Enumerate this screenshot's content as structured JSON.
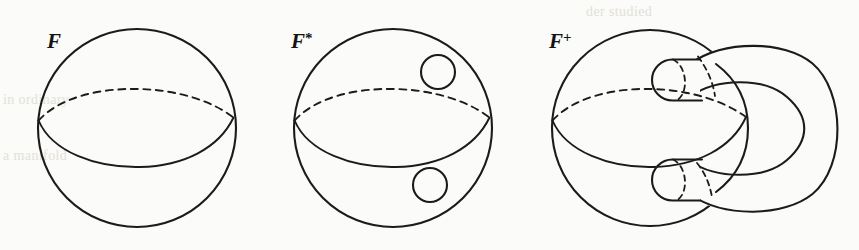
{
  "figure": {
    "name": "surface-handle-construction",
    "background_color": "#fbfbf9",
    "ink_color": "#1b1b1b",
    "width": 859,
    "height": 250,
    "caption": "",
    "panels": [
      {
        "id": "panel-f",
        "label": "F",
        "label_superscript": "",
        "description": "closed sphere with equator, dashed back arc and solid front arc",
        "holes": 0,
        "handles": 0
      },
      {
        "id": "panel-f-star",
        "label": "F",
        "label_superscript": "*",
        "description": "sphere with two boundary circles (punctures), one above and one below the equator",
        "holes": 2,
        "handles": 0
      },
      {
        "id": "panel-f-plus",
        "label": "F",
        "label_superscript": "+",
        "description": "sphere with the two punctures joined by an external C-shaped handle tube",
        "holes": 0,
        "handles": 1
      }
    ]
  },
  "bleed_through": {
    "visible": true,
    "lines": [
      "der studied",
      "in ordinary",
      "a manifold",
      "all be in"
    ]
  }
}
